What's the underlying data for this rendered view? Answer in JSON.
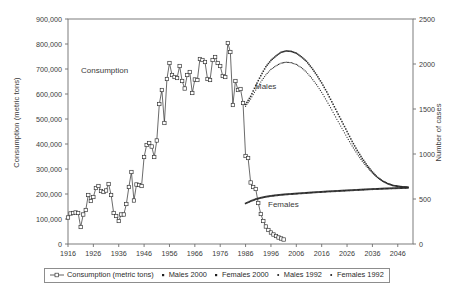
{
  "figure": {
    "background": "#ffffff",
    "plot_border_color": "#6e6e6e",
    "ink_color": "#2b2b2b"
  },
  "legend": {
    "entries": [
      {
        "label": "Consumption (metric tons)",
        "marker": "line-open-square-marker",
        "color": "#3a3a3a"
      },
      {
        "label": "Males 2000",
        "marker": "small-filled-square-marker",
        "color": "#1f1f1f"
      },
      {
        "label": "Females 2000",
        "marker": "small-filled-square-marker",
        "color": "#1f1f1f"
      },
      {
        "label": "Males 1992",
        "marker": "small-dot-marker",
        "color": "#1f1f1f"
      },
      {
        "label": "Females 1992",
        "marker": "small-dot-marker",
        "color": "#1f1f1f"
      }
    ]
  },
  "annotations": [
    {
      "text": "Consumption",
      "x": 81,
      "y": 66,
      "name": "consumption-annotation"
    },
    {
      "text": "Males",
      "x": 255,
      "y": 82,
      "name": "males-annotation"
    },
    {
      "text": "Females",
      "x": 268,
      "y": 200,
      "name": "females-annotation"
    }
  ],
  "chart_data": {
    "type": "line",
    "title": "",
    "xlabel": "",
    "ylabel": "Consumption (metric tons)",
    "y2label": "Number of cases",
    "grid": false,
    "legend_position": "bottom",
    "xlim": [
      1916,
      2052
    ],
    "ylim": [
      0,
      900000
    ],
    "y2lim": [
      0,
      2500
    ],
    "xticks": [
      1916,
      1926,
      1936,
      1946,
      1956,
      1966,
      1976,
      1986,
      1996,
      2006,
      2016,
      2026,
      2036,
      2046
    ],
    "xtick_labels": [
      "1916",
      "1926",
      "1936",
      "1946",
      "1956",
      "1966",
      "1976",
      "1986",
      "1996",
      "2006",
      "2016",
      "2026",
      "2036",
      "2046"
    ],
    "yticks": [
      0,
      100000,
      200000,
      300000,
      400000,
      500000,
      600000,
      700000,
      800000,
      900000
    ],
    "ytick_labels": [
      "0",
      "100,000",
      "200,000",
      "300,000",
      "400,000",
      "500,000",
      "600,000",
      "700,000",
      "800,000",
      "900,000"
    ],
    "y2ticks": [
      0,
      500,
      1000,
      1500,
      2000,
      2500
    ],
    "y2tick_labels": [
      "0",
      "500",
      "1000",
      "1500",
      "2000",
      "2500"
    ],
    "series": [
      {
        "name": "Consumption (metric tons)",
        "axis": "left",
        "style": "line-with-open-square-markers",
        "x": [
          1916,
          1917,
          1918,
          1919,
          1920,
          1921,
          1922,
          1923,
          1924,
          1925,
          1926,
          1927,
          1928,
          1929,
          1930,
          1931,
          1932,
          1933,
          1934,
          1935,
          1936,
          1937,
          1938,
          1939,
          1940,
          1941,
          1942,
          1943,
          1944,
          1945,
          1946,
          1947,
          1948,
          1949,
          1950,
          1951,
          1952,
          1953,
          1954,
          1955,
          1956,
          1957,
          1958,
          1959,
          1960,
          1961,
          1962,
          1963,
          1964,
          1965,
          1966,
          1967,
          1968,
          1969,
          1970,
          1971,
          1972,
          1973,
          1974,
          1975,
          1976,
          1977,
          1978,
          1979,
          1980,
          1981,
          1982,
          1983,
          1984,
          1985,
          1986,
          1987,
          1988,
          1989,
          1990,
          1991,
          1992,
          1993,
          1994,
          1995,
          1996,
          1997,
          1998,
          1999,
          2000,
          2001
        ],
        "values": [
          106000,
          122000,
          124000,
          126000,
          124000,
          68000,
          118000,
          136000,
          196000,
          172000,
          188000,
          224000,
          232000,
          212000,
          208000,
          214000,
          240000,
          196000,
          124000,
          112000,
          92000,
          118000,
          118000,
          160000,
          228000,
          288000,
          174000,
          238000,
          236000,
          232000,
          348000,
          396000,
          404000,
          390000,
          348000,
          414000,
          560000,
          616000,
          484000,
          660000,
          724000,
          676000,
          668000,
          664000,
          712000,
          652000,
          622000,
          676000,
          688000,
          604000,
          658000,
          656000,
          740000,
          736000,
          728000,
          660000,
          656000,
          736000,
          748000,
          724000,
          712000,
          672000,
          668000,
          804000,
          768000,
          556000,
          652000,
          616000,
          620000,
          564000,
          352000,
          344000,
          246000,
          228000,
          220000,
          164000,
          120000,
          92000,
          70000,
          56000,
          46000,
          38000,
          32000,
          26000,
          22000,
          18000
        ]
      },
      {
        "name": "Males 2000",
        "axis": "right",
        "style": "filled-square-dots",
        "x": [
          1986,
          1988,
          1990,
          1992,
          1994,
          1996,
          1998,
          2000,
          2002,
          2004,
          2006,
          2008,
          2010,
          2012,
          2014,
          2016,
          2018,
          2020,
          2022,
          2024,
          2026,
          2028,
          2030,
          2032,
          2034,
          2036,
          2038,
          2040,
          2042,
          2044,
          2046,
          2048,
          2050
        ],
        "values": [
          1550,
          1640,
          1760,
          1870,
          1970,
          2040,
          2090,
          2130,
          2145,
          2140,
          2120,
          2080,
          2030,
          1960,
          1880,
          1790,
          1690,
          1580,
          1470,
          1360,
          1250,
          1140,
          1040,
          950,
          870,
          800,
          740,
          700,
          670,
          650,
          640,
          635,
          630
        ]
      },
      {
        "name": "Males 1992",
        "axis": "right",
        "style": "dot-line",
        "x": [
          1986,
          1988,
          1990,
          1992,
          1994,
          1996,
          1998,
          2000,
          2002,
          2004,
          2006,
          2008,
          2010,
          2012,
          2014,
          2016,
          2018,
          2020,
          2022,
          2024,
          2026,
          2028,
          2030,
          2032,
          2034,
          2036,
          2038,
          2040,
          2042,
          2044,
          2046,
          2048,
          2050
        ],
        "values": [
          1530,
          1610,
          1710,
          1800,
          1880,
          1940,
          1980,
          2010,
          2020,
          2015,
          1995,
          1960,
          1910,
          1845,
          1770,
          1685,
          1590,
          1490,
          1385,
          1285,
          1185,
          1090,
          1000,
          920,
          850,
          790,
          740,
          700,
          675,
          655,
          645,
          638,
          632
        ]
      },
      {
        "name": "Females 2000",
        "axis": "right",
        "style": "filled-square-dots",
        "x": [
          1986,
          1988,
          1990,
          1992,
          1994,
          1996,
          1998,
          2000,
          2002,
          2004,
          2006,
          2008,
          2010,
          2012,
          2014,
          2016,
          2018,
          2020,
          2022,
          2024,
          2026,
          2028,
          2030,
          2032,
          2034,
          2036,
          2038,
          2040,
          2042,
          2044,
          2046,
          2048,
          2050
        ],
        "values": [
          452,
          478,
          500,
          515,
          527,
          536,
          543,
          549,
          554,
          558,
          562,
          566,
          570,
          574,
          578,
          581,
          585,
          588,
          591,
          594,
          597,
          600,
          603,
          606,
          609,
          612,
          614,
          617,
          619,
          621,
          623,
          625,
          627
        ]
      },
      {
        "name": "Females 1992",
        "axis": "right",
        "style": "dot-line",
        "x": [
          1986,
          1988,
          1990,
          1992,
          1994,
          1996,
          1998,
          2000,
          2002,
          2004,
          2006,
          2008,
          2010,
          2012,
          2014,
          2016,
          2018,
          2020,
          2022,
          2024,
          2026,
          2028,
          2030,
          2032,
          2034,
          2036,
          2038,
          2040,
          2042,
          2044,
          2046,
          2048,
          2050
        ],
        "values": [
          448,
          472,
          493,
          508,
          520,
          529,
          536,
          542,
          547,
          551,
          555,
          559,
          563,
          567,
          571,
          574,
          578,
          581,
          584,
          587,
          590,
          593,
          596,
          599,
          602,
          605,
          607,
          610,
          612,
          614,
          616,
          618,
          620
        ]
      }
    ]
  }
}
